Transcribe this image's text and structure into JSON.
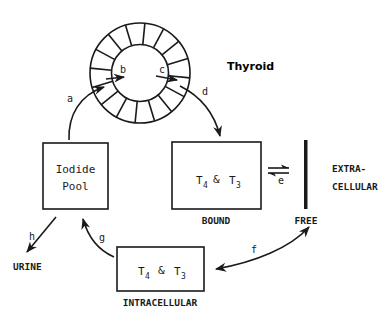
{
  "diagram": {
    "header_text": "",
    "thyroid": {
      "label": "Thyroid",
      "ring_segments": 16
    },
    "iodide_pool": {
      "line1": "Iodide",
      "line2": "Pool"
    },
    "bound": {
      "t4": "T",
      "t4_sub": "4",
      "amp": "&",
      "t3": "T",
      "t3_sub": "3",
      "caption": "BOUND"
    },
    "free": {
      "caption": "FREE"
    },
    "extracellular": {
      "line1": "EXTRA-",
      "line2": "CELLULAR"
    },
    "intracellular": {
      "t4": "T",
      "t4_sub": "4",
      "amp": "&",
      "t3": "T",
      "t3_sub": "3",
      "caption": "INTRACELLULAR"
    },
    "urine": {
      "caption": "URINE"
    },
    "pathways": {
      "a": "a",
      "b": "b",
      "c": "c",
      "d": "d",
      "e": "e",
      "f": "f",
      "g": "g",
      "h": "h"
    },
    "colors": {
      "ink": "#1a1a1a",
      "background": "#ffffff"
    }
  }
}
